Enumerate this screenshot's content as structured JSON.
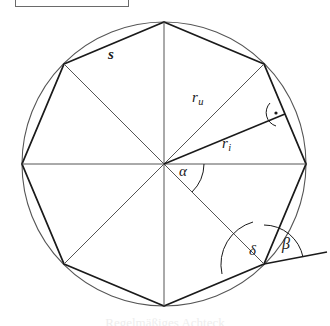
{
  "figure": {
    "type": "geometry-diagram",
    "caption": "Regelmäßiges Achteck",
    "top_box": {
      "present": true,
      "label": ""
    },
    "colors": {
      "stroke": "#1a1a1a",
      "circle_stroke": "#555555",
      "thin_stroke": "#666666",
      "background": "#ffffff"
    },
    "circle": {
      "cx": 164,
      "cy": 164,
      "r": 142
    },
    "polygon": {
      "sides": 8,
      "vertices": [
        {
          "x": 164,
          "y": 22
        },
        {
          "x": 264,
          "y": 64
        },
        {
          "x": 306,
          "y": 164
        },
        {
          "x": 264,
          "y": 264
        },
        {
          "x": 164,
          "y": 306
        },
        {
          "x": 64,
          "y": 264
        },
        {
          "x": 22,
          "y": 164
        },
        {
          "x": 64,
          "y": 64
        }
      ]
    },
    "labels": {
      "side": {
        "symbol": "s",
        "name": "side-length"
      },
      "circumradius": {
        "symbol": "r",
        "subscript": "u",
        "name": "circumradius"
      },
      "inradius": {
        "symbol": "r",
        "subscript": "i",
        "name": "inradius"
      },
      "central_angle": {
        "symbol": "α",
        "name": "central-angle"
      },
      "interior_angle": {
        "symbol": "δ",
        "name": "interior-angle"
      },
      "exterior_angle": {
        "symbol": "β",
        "name": "exterior-angle"
      }
    },
    "markers": {
      "right_angle": {
        "symbol": "⊥",
        "x": 275,
        "y": 112,
        "name": "right-angle-marker"
      }
    }
  }
}
